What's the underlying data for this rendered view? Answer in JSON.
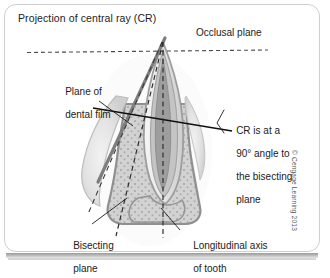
{
  "figure": {
    "title": "Projection of central ray (CR)",
    "copyright": "© Cengage Learning 2013"
  },
  "labels": {
    "occlusal_plane": "Occlusal plane",
    "plane_of_dental_film_line1": "Plane of",
    "plane_of_dental_film_line2": "dental film",
    "cr_angle_line1": "CR is at a",
    "cr_angle_line2": "90° angle to",
    "cr_angle_line3": "the bisecting",
    "cr_angle_line4": "plane",
    "bisecting_plane_line1": "Bisecting",
    "bisecting_plane_line2": "plane",
    "longitudinal_axis_line1": "Longitudinal axis",
    "longitudinal_axis_line2": "of tooth"
  },
  "colors": {
    "panel_border": "#cfcfcf",
    "text": "#1b1b1b",
    "film_plane_line": "#7a7a7a",
    "cr_line": "#111111",
    "dashed_line": "#3a3a3a",
    "occlusal_dash": "#4a4a4a",
    "bone_fill": "#cfcfcf",
    "bone_edge": "#9a9a9a",
    "tooth_enamel": "#e9e9e9",
    "tooth_dentin": "#bfbfbf",
    "pulp": "#a5a5a5",
    "gingiva": "#dedede",
    "copyright_text": "#555555"
  },
  "geometry": {
    "apex_point": [
      163,
      40
    ],
    "occlusal_plane_y": 52,
    "occlusal_plane_x_start": 27,
    "occlusal_plane_x_end": 268,
    "cr_angle_marker": [
      218,
      122
    ]
  }
}
